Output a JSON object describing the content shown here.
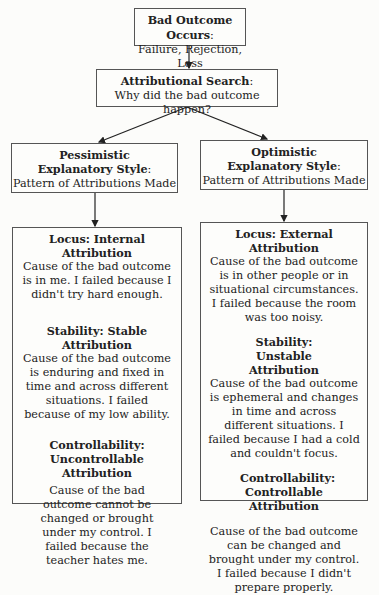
{
  "diagram": {
    "top": {
      "title": "Bad Outcome Occurs",
      "text": "Failure, Rejection, Loss"
    },
    "search": {
      "title": "Attributional Search",
      "text": "Why did the bad outcome happen?"
    },
    "pessimistic": {
      "title_line1": "Pessimistic",
      "title_line2": "Explanatory Style",
      "text": "Pattern of Attributions Made"
    },
    "optimistic": {
      "title_line1": "Optimistic",
      "title_line2": "Explanatory Style",
      "text": "Pattern of Attributions Made"
    },
    "pessimistic_details": {
      "locus": {
        "title": "Locus: Internal Attribution",
        "text": "Cause of the bad outcome is in me. I failed because I didn't try hard enough."
      },
      "stability": {
        "title": "Stability: Stable Attribution",
        "text": "Cause of the bad outcome is enduring and fixed in time and across different situations. I failed because of my low ability."
      },
      "controllability": {
        "title": "Controllability: Uncontrollable Attribution",
        "text": "Cause of the bad outcome cannot be changed or brought under my control. I failed because the teacher hates me."
      }
    },
    "optimistic_details": {
      "locus": {
        "title": "Locus: External Attribution",
        "text": "Cause of the bad outcome is in other people or in situational circumstances. I failed because the room was too noisy."
      },
      "stability": {
        "title": "Stability: Unstable Attribution",
        "text": "Cause of the bad outcome is ephemeral and changes in time and across different situations. I failed because I had a cold and couldn't focus."
      },
      "controllability": {
        "title": "Controllability: Controllable Attribution",
        "text": "Cause of the bad outcome can be changed and brought under my control. I failed because I didn't prepare properly."
      }
    }
  }
}
